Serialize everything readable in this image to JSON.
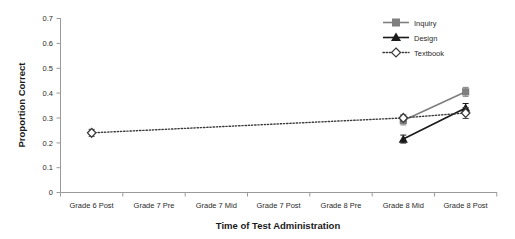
{
  "chart_data": {
    "type": "line",
    "title": "",
    "xlabel": "Time of Test Administration",
    "ylabel": "Proportion Correct",
    "categories": [
      "Grade 6 Post",
      "Grade 7 Pre",
      "Grade 7 Mid",
      "Grade 7 Post",
      "Grade 8 Pre",
      "Grade 8 Mid",
      "Grade 8 Post"
    ],
    "ylim": [
      0,
      0.7
    ],
    "yticks": [
      0,
      0.1,
      0.2,
      0.3,
      0.4,
      0.5,
      0.6,
      0.7
    ],
    "ytick_labels": [
      "0",
      "0.1",
      "0.2",
      "0.3",
      "0.4",
      "0.5",
      "0.6",
      "0.7"
    ],
    "grid": false,
    "legend_position": "top-right",
    "series": [
      {
        "name": "Inquiry",
        "marker": "square",
        "color": "#7f7f7f",
        "line_style": "solid",
        "values": [
          null,
          null,
          null,
          null,
          null,
          0.29,
          0.405
        ],
        "errors": [
          null,
          null,
          null,
          null,
          null,
          0.018,
          0.018
        ]
      },
      {
        "name": "Design",
        "marker": "triangle",
        "color": "#1a1a1a",
        "line_style": "solid",
        "values": [
          null,
          null,
          null,
          null,
          null,
          0.215,
          0.34
        ],
        "errors": [
          null,
          null,
          null,
          null,
          null,
          0.016,
          0.018
        ]
      },
      {
        "name": "Textbook",
        "marker": "diamond",
        "color": "#3a3a3a",
        "line_style": "dotted",
        "values": [
          0.24,
          null,
          null,
          null,
          null,
          0.3,
          0.32
        ],
        "errors": [
          0.014,
          null,
          null,
          null,
          null,
          0.012,
          0.022
        ]
      }
    ]
  },
  "legend": {
    "entries": [
      {
        "label": "Inquiry"
      },
      {
        "label": "Design"
      },
      {
        "label": "Textbook"
      }
    ]
  }
}
